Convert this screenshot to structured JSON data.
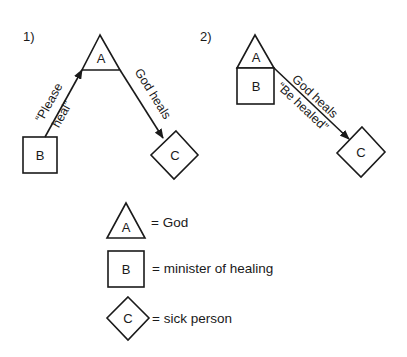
{
  "colors": {
    "ink": "#1a1a1a",
    "background": "#ffffff"
  },
  "diagram1": {
    "number": "1)",
    "nodes": {
      "a": "A",
      "b": "B",
      "c": "C"
    },
    "edges": {
      "b_to_a_line1": "“Please",
      "b_to_a_line2": "heal”",
      "a_to_c": "God heals"
    }
  },
  "diagram2": {
    "number": "2)",
    "nodes": {
      "a": "A",
      "b": "B",
      "c": "C"
    },
    "edges": {
      "ab_to_c_line1": "God heals",
      "ab_to_c_line2": "“Be healed”"
    }
  },
  "legend": {
    "items": [
      {
        "shape": "triangle",
        "letter": "A",
        "meaning": "= God"
      },
      {
        "shape": "square",
        "letter": "B",
        "meaning": "= minister of healing"
      },
      {
        "shape": "diamond",
        "letter": "C",
        "meaning": "= sick person"
      }
    ]
  }
}
